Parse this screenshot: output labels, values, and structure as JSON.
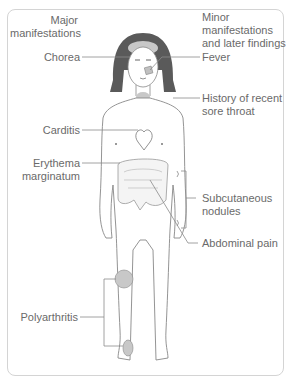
{
  "diagram": {
    "headers": {
      "major": [
        "Major",
        "manifestations"
      ],
      "minor": [
        "Minor",
        "manifestations",
        "and later findings"
      ]
    },
    "major_labels": {
      "chorea": "Chorea",
      "carditis": "Carditis",
      "erythema": [
        "Erythema",
        "marginatum"
      ],
      "polyarthritis": "Polyarthritis"
    },
    "minor_labels": {
      "fever": "Fever",
      "sore_throat": [
        "History of recent",
        "sore throat"
      ],
      "nodules": [
        "Subcutaneous",
        "nodules"
      ],
      "abdominal_pain": "Abdominal pain"
    },
    "colors": {
      "text": "#6a6a6a",
      "line": "#8a8a8a",
      "hair": "#555555",
      "highlight": "#c8c8c8",
      "frame": "#d4d4d4"
    }
  }
}
